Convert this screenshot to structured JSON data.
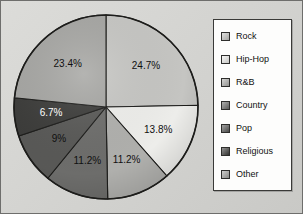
{
  "figure": {
    "background_color": "#d6d6d3",
    "border_color": "#6e6e6c"
  },
  "legend": {
    "position": "right",
    "background_color": "#fdfdfc",
    "border_color": "#3a3a38",
    "items": [
      {
        "label": "Rock",
        "color": "#c9c9c6"
      },
      {
        "label": "Hip-Hop",
        "color": "#f2f2ef"
      },
      {
        "label": "R&B",
        "color": "#b3b3b0"
      },
      {
        "label": "Country",
        "color": "#6f6f6d"
      },
      {
        "label": "Pop",
        "color": "#5a5a58"
      },
      {
        "label": "Religious",
        "color": "#3d3d3b"
      },
      {
        "label": "Other",
        "color": "#a8a8a5"
      }
    ]
  },
  "chart_data": {
    "type": "pie",
    "title": "",
    "categories": [
      "Rock",
      "Hip-Hop",
      "R&B",
      "Country",
      "Pop",
      "Religious",
      "Other"
    ],
    "values": [
      24.7,
      13.8,
      11.2,
      11.2,
      9,
      6.7,
      23.4
    ],
    "labels": [
      "24.7%",
      "13.8%",
      "11.2%",
      "11.2%",
      "9%",
      "6.7%",
      "23.4%"
    ],
    "colors": [
      "#c9c9c6",
      "#f2f2ef",
      "#b3b3b0",
      "#6f6f6d",
      "#5a5a58",
      "#3d3d3b",
      "#a8a8a5"
    ],
    "label_text_colors": [
      "#101010",
      "#101010",
      "#101010",
      "#101010",
      "#101010",
      "#ffffff",
      "#101010"
    ],
    "start_angle_deg": 0,
    "direction": "clockwise",
    "units": "percent",
    "legend_position": "right",
    "grid": false
  }
}
